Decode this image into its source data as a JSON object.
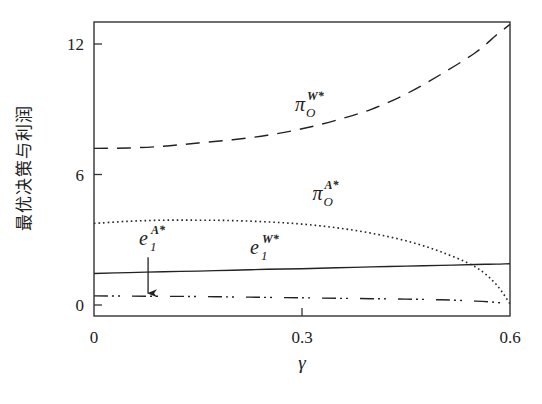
{
  "chart_data": {
    "type": "line",
    "title": "",
    "xlabel": "γ",
    "ylabel": "最优决策与利润",
    "xlim": [
      0,
      0.6
    ],
    "ylim": [
      -0.35,
      12.9
    ],
    "xticks": [
      0,
      0.3,
      0.6
    ],
    "xtick_labels": [
      "0",
      "0.3",
      "0.6"
    ],
    "yticks": [
      0,
      6,
      12
    ],
    "ytick_labels": [
      "0",
      "6",
      "12"
    ],
    "grid": false,
    "legend": "none (inline annotations)",
    "x": [
      0,
      0.05,
      0.1,
      0.15,
      0.2,
      0.25,
      0.3,
      0.35,
      0.4,
      0.45,
      0.5,
      0.55,
      0.58,
      0.6
    ],
    "series": [
      {
        "name": "π_O^{W*}",
        "style": "dashed",
        "values": [
          7.2,
          7.22,
          7.3,
          7.45,
          7.6,
          7.8,
          8.1,
          8.5,
          9.0,
          9.7,
          10.6,
          11.6,
          12.4,
          12.9
        ]
      },
      {
        "name": "π_O^{A*}",
        "style": "dotted",
        "values": [
          3.75,
          3.85,
          3.9,
          3.9,
          3.88,
          3.82,
          3.72,
          3.55,
          3.3,
          2.95,
          2.45,
          1.75,
          0.95,
          0.05
        ]
      },
      {
        "name": "e_1^{W*}",
        "style": "solid",
        "values": [
          1.45,
          1.49,
          1.53,
          1.56,
          1.6,
          1.64,
          1.67,
          1.71,
          1.75,
          1.79,
          1.82,
          1.86,
          1.88,
          1.9
        ]
      },
      {
        "name": "e_1^{A*}",
        "style": "dashdot",
        "values": [
          0.42,
          0.41,
          0.4,
          0.39,
          0.37,
          0.35,
          0.33,
          0.31,
          0.29,
          0.27,
          0.24,
          0.18,
          0.12,
          0.05
        ]
      }
    ],
    "annotations": [
      {
        "text": "π",
        "sub": "O",
        "sup": "W*",
        "x": 0.29,
        "y": 8.9,
        "target": "π_O^{W*}"
      },
      {
        "text": "π",
        "sub": "O",
        "sup": "A*",
        "x": 0.315,
        "y": 4.85,
        "target": "π_O^{A*}"
      },
      {
        "text": "e",
        "sub": "1",
        "sup": "W*",
        "x": 0.225,
        "y": 2.35,
        "target": "e_1^{W*}"
      },
      {
        "text": "e",
        "sub": "1",
        "sup": "A*",
        "x": 0.065,
        "y": 2.75,
        "target": "e_1^{A*}",
        "arrow": {
          "from": [
            0.078,
            2.2
          ],
          "to": [
            0.078,
            0.45
          ]
        }
      }
    ]
  },
  "colors": {
    "line": "#222222",
    "frame": "#333333",
    "background": "#ffffff"
  }
}
